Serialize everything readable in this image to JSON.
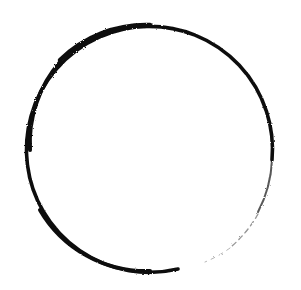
{
  "image": {
    "subject": "brush-stroke circle",
    "background_color": "#ffffff",
    "stroke_color": "#111111",
    "center": [
      150,
      148
    ],
    "radius": 124,
    "gap_region": "lower-right"
  }
}
